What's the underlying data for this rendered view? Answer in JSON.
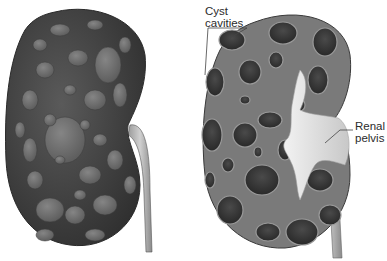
{
  "figure": {
    "views": [
      {
        "id": "exterior",
        "description": "External view of kidney with surface cysts and ureter"
      },
      {
        "id": "cross-section",
        "description": "Sectioned kidney showing cyst cavities and renal pelvis"
      }
    ],
    "labels": {
      "cyst_cavities": "Cyst\ncavities",
      "renal_pelvis": "Renal\npelvis"
    },
    "colors": {
      "exterior_body": "#4a4a4a",
      "exterior_cyst": "#6e6e6e",
      "section_tissue": "#7a7a7a",
      "cavity": "#3a3a3a",
      "pelvis": "#e4e4e4",
      "ureter": "#bdbdbd",
      "leader_line": "#444444"
    }
  }
}
